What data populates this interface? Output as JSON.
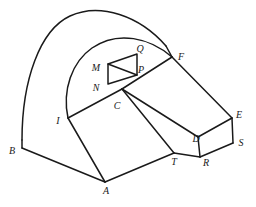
{
  "figure": {
    "type": "technical-line-drawing",
    "width": 256,
    "height": 207,
    "background_color": "#ffffff",
    "line_color": "#1a1a1a",
    "label_color": "#1a1a1a",
    "stroke_width": 1.5,
    "label_style": "italic-serif",
    "label_font_size": 10
  },
  "labels": [
    {
      "id": "Q",
      "text": "Q",
      "x": 140,
      "y": 49
    },
    {
      "id": "F",
      "text": "F",
      "x": 181,
      "y": 57
    },
    {
      "id": "M",
      "text": "M",
      "x": 96,
      "y": 68
    },
    {
      "id": "P",
      "text": "P",
      "x": 141,
      "y": 70
    },
    {
      "id": "N",
      "text": "N",
      "x": 96,
      "y": 88
    },
    {
      "id": "E",
      "text": "E",
      "x": 239,
      "y": 115
    },
    {
      "id": "C",
      "text": "C",
      "x": 117,
      "y": 106
    },
    {
      "id": "I",
      "text": "I",
      "x": 58,
      "y": 121
    },
    {
      "id": "D",
      "text": "D",
      "x": 196,
      "y": 139
    },
    {
      "id": "S",
      "text": "S",
      "x": 241,
      "y": 143
    },
    {
      "id": "B",
      "text": "B",
      "x": 12,
      "y": 151
    },
    {
      "id": "T",
      "text": "T",
      "x": 174,
      "y": 162
    },
    {
      "id": "R",
      "text": "R",
      "x": 206,
      "y": 163
    },
    {
      "id": "A",
      "text": "A",
      "x": 106,
      "y": 191
    }
  ],
  "geometry": {
    "outer_vault_arc": "M 22,140 C 22,80 40,30 70,16 C 100,2 140,16 166,46",
    "inner_vault_arc": "M 68,118 C 62,90 72,62 92,48 C 118,30 150,38 172,57",
    "left_wall_edge": "M 22,140 L 22,148",
    "vault_to_F_edge": "M 166,46 L 172,57",
    "outlines": [
      {
        "name": "base-front-left-edge",
        "d": "M 22,148 L 105,182"
      },
      {
        "name": "base-front-right-edge",
        "d": "M 105,182 L 174,153"
      },
      {
        "name": "slope-left-edge-I-A",
        "d": "M 68,118 L 105,182"
      },
      {
        "name": "ridge-I-C",
        "d": "M 68,118 L 122,89"
      },
      {
        "name": "ridge-C-F",
        "d": "M 122,89 L 172,57"
      },
      {
        "name": "roof-F-E",
        "d": "M 172,57 L 232,118"
      },
      {
        "name": "roof-C-D",
        "d": "M 122,89 L 198,137"
      },
      {
        "name": "roof-D-E",
        "d": "M 198,137 L 232,118"
      },
      {
        "name": "face-C-T",
        "d": "M 122,89 L 174,153"
      },
      {
        "name": "base-T-R",
        "d": "M 174,153 L 200,157"
      },
      {
        "name": "box-D-R",
        "d": "M 198,137 L 200,157"
      },
      {
        "name": "box-R-S",
        "d": "M 200,157 L 233,143"
      },
      {
        "name": "box-E-S",
        "d": "M 232,118 L 233,143"
      }
    ],
    "opening_parallelogram": {
      "name": "MNPQ-opening",
      "vertices": [
        {
          "id": "M",
          "x": 108,
          "y": 64
        },
        {
          "id": "Q",
          "x": 137,
          "y": 54
        },
        {
          "id": "P",
          "x": 137,
          "y": 75
        },
        {
          "id": "N",
          "x": 108,
          "y": 84
        }
      ],
      "diagonal": "M 108,64 L 137,75"
    }
  }
}
